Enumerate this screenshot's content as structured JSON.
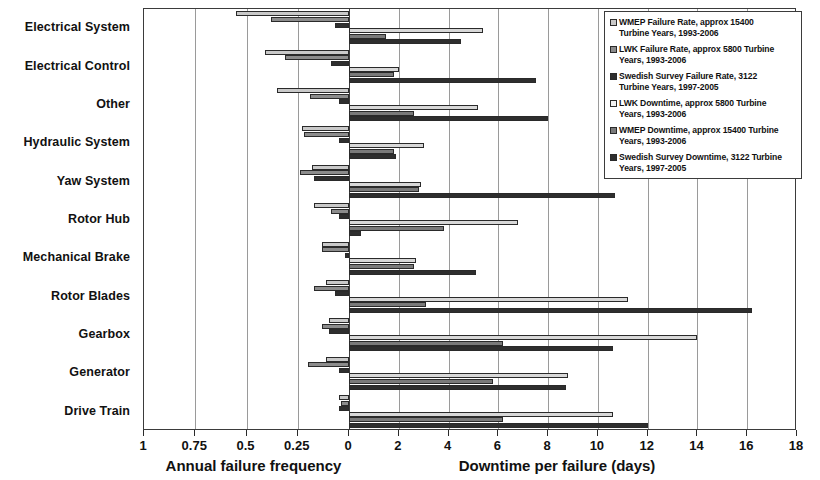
{
  "chart_data": {
    "type": "bar",
    "orientation": "horizontal",
    "title": "",
    "categories": [
      "Electrical System",
      "Electrical Control",
      "Other",
      "Hydraulic System",
      "Yaw System",
      "Rotor Hub",
      "Mechanical Brake",
      "Rotor Blades",
      "Gearbox",
      "Generator",
      "Drive Train"
    ],
    "left_axis": {
      "label": "Annual failure frequency",
      "ticks": [
        1,
        0.75,
        0.5,
        0.25,
        0
      ],
      "range": [
        1,
        0
      ],
      "direction": "right-to-left"
    },
    "right_axis": {
      "label": "Downtime per failure (days)",
      "ticks": [
        0,
        2,
        4,
        6,
        8,
        10,
        12,
        14,
        16,
        18
      ],
      "range": [
        0,
        18
      ],
      "direction": "left-to-right"
    },
    "grid": "vertical",
    "legend_position": "top-right",
    "series": [
      {
        "name": "WMEP Failure Rate, approx 15400 Turbine Years, 1993-2006",
        "short": "WMEP Failure Rate",
        "axis": "left",
        "color": "#c9c9c9",
        "values": [
          0.55,
          0.41,
          0.35,
          0.23,
          0.18,
          0.17,
          0.13,
          0.11,
          0.1,
          0.11,
          0.05
        ]
      },
      {
        "name": "LWK Failure Rate, approx 5800 Turbine Years, 1993-2006",
        "short": "LWK Failure Rate",
        "axis": "left",
        "color": "#8c8c8c",
        "values": [
          0.38,
          0.31,
          0.19,
          0.22,
          0.24,
          0.09,
          0.13,
          0.17,
          0.13,
          0.2,
          0.04
        ]
      },
      {
        "name": "Swedish Survey Failure Rate, 3122 Turbine Years, 1997-2005",
        "short": "Swedish Survey Failure Rate",
        "axis": "left",
        "color": "#2e2e2e",
        "values": [
          0.07,
          0.09,
          0.05,
          0.05,
          0.17,
          0.05,
          0.02,
          0.07,
          0.1,
          0.05,
          0.05
        ]
      },
      {
        "name": "LWK Downtime, approx 5800 Turbine Years, 1993-2006",
        "short": "LWK Downtime",
        "axis": "right",
        "color": "#d8d8d8",
        "values": [
          5.4,
          2.0,
          5.2,
          3.0,
          2.9,
          6.8,
          2.7,
          11.2,
          14.0,
          8.8,
          10.6
        ]
      },
      {
        "name": "WMEP Downtime, approx 15400 Turbine Years, 1993-2006",
        "short": "WMEP Downtime",
        "axis": "right",
        "color": "#7a7a7a",
        "values": [
          1.5,
          1.8,
          2.6,
          1.8,
          2.8,
          3.8,
          2.6,
          3.1,
          6.2,
          5.8,
          6.2
        ]
      },
      {
        "name": "Swedish Survey Downtime, 3122 Turbine Years, 1997-2005",
        "short": "Swedish Survey Downtime",
        "axis": "right",
        "color": "#2e2e2e",
        "values": [
          4.5,
          7.5,
          8.0,
          1.9,
          10.7,
          0.5,
          5.1,
          16.2,
          10.6,
          8.7,
          12.0
        ]
      }
    ]
  },
  "legend": {
    "items": [
      {
        "swatch": "#c9c9c9",
        "line1": "WMEP Failure Rate, approx 15400",
        "line2": "Turbine Years, 1993-2006"
      },
      {
        "swatch": "#8c8c8c",
        "line1": "LWK Failure Rate, approx 5800 Turbine",
        "line2": "Years, 1993-2006"
      },
      {
        "swatch": "#2e2e2e",
        "line1": "Swedish Survey Failure Rate, 3122",
        "line2": "Turbine Years, 1997-2005"
      },
      {
        "swatch": "#f2f2f2",
        "line1": "LWK Downtime, approx 5800 Turbine",
        "line2": "Years, 1993-2006"
      },
      {
        "swatch": "#7a7a7a",
        "line1": "WMEP Downtime, approx 15400 Turbine",
        "line2": "Years, 1993-2006"
      },
      {
        "swatch": "#2e2e2e",
        "line1": "Swedish Survey Downtime, 3122 Turbine",
        "line2": "Years, 1997-2005"
      }
    ]
  },
  "axis_titles": {
    "left": "Annual failure frequency",
    "right": "Downtime per failure (days)"
  }
}
